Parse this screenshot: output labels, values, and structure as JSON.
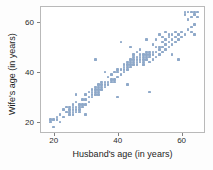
{
  "chart_data": {
    "type": "scatter",
    "title": "",
    "xlabel": "Husband's age (in years)",
    "ylabel": "Wife's age (in years)",
    "xlim": [
      16,
      67
    ],
    "ylim": [
      16,
      66
    ],
    "xticks": [
      20,
      40,
      60
    ],
    "yticks": [
      20,
      40,
      60
    ],
    "xticklabels": [
      "20",
      "40",
      "60"
    ],
    "yticklabels": [
      "20",
      "40",
      "60"
    ],
    "grid": false,
    "legend": null,
    "marker_color": "#8fa9c9",
    "frame_color": "#b9b9b9",
    "series": [
      {
        "name": "couples",
        "points": [
          [
            19,
            21
          ],
          [
            19,
            20
          ],
          [
            20,
            18
          ],
          [
            20,
            21
          ],
          [
            21,
            21
          ],
          [
            21,
            22
          ],
          [
            22,
            20
          ],
          [
            22,
            23
          ],
          [
            23,
            22
          ],
          [
            23,
            25
          ],
          [
            24,
            24
          ],
          [
            24,
            26
          ],
          [
            25,
            23
          ],
          [
            25,
            25
          ],
          [
            25,
            24
          ],
          [
            25,
            26
          ],
          [
            26,
            24
          ],
          [
            26,
            25
          ],
          [
            26,
            26
          ],
          [
            26,
            27
          ],
          [
            26,
            23
          ],
          [
            27,
            24
          ],
          [
            27,
            25
          ],
          [
            27,
            26
          ],
          [
            27,
            28
          ],
          [
            27,
            31
          ],
          [
            28,
            25
          ],
          [
            28,
            26
          ],
          [
            28,
            27
          ],
          [
            28,
            24
          ],
          [
            29,
            27
          ],
          [
            29,
            29
          ],
          [
            29,
            26
          ],
          [
            30,
            23
          ],
          [
            30,
            27
          ],
          [
            30,
            29
          ],
          [
            30,
            31
          ],
          [
            31,
            28
          ],
          [
            31,
            32
          ],
          [
            31,
            30
          ],
          [
            32,
            31
          ],
          [
            32,
            32
          ],
          [
            32,
            33
          ],
          [
            32,
            30
          ],
          [
            33,
            31
          ],
          [
            33,
            32
          ],
          [
            33,
            33
          ],
          [
            33,
            34
          ],
          [
            33,
            45
          ],
          [
            34,
            32
          ],
          [
            34,
            33
          ],
          [
            34,
            34
          ],
          [
            34,
            35
          ],
          [
            34,
            31
          ],
          [
            35,
            33
          ],
          [
            35,
            34
          ],
          [
            35,
            35
          ],
          [
            35,
            36
          ],
          [
            36,
            34
          ],
          [
            36,
            35
          ],
          [
            36,
            36
          ],
          [
            36,
            40
          ],
          [
            37,
            35
          ],
          [
            37,
            36
          ],
          [
            37,
            38
          ],
          [
            38,
            36
          ],
          [
            38,
            37
          ],
          [
            38,
            39
          ],
          [
            39,
            37
          ],
          [
            39,
            40
          ],
          [
            39,
            36
          ],
          [
            40,
            30
          ],
          [
            40,
            38
          ],
          [
            40,
            40
          ],
          [
            40,
            41
          ],
          [
            41,
            39
          ],
          [
            41,
            41
          ],
          [
            41,
            52
          ],
          [
            42,
            40
          ],
          [
            42,
            41
          ],
          [
            42,
            42
          ],
          [
            42,
            43
          ],
          [
            43,
            35
          ],
          [
            43,
            41
          ],
          [
            43,
            42
          ],
          [
            43,
            43
          ],
          [
            43,
            44
          ],
          [
            44,
            42
          ],
          [
            44,
            43
          ],
          [
            44,
            44
          ],
          [
            44,
            45
          ],
          [
            44,
            50
          ],
          [
            45,
            43
          ],
          [
            45,
            44
          ],
          [
            45,
            45
          ],
          [
            45,
            46
          ],
          [
            45,
            47
          ],
          [
            46,
            43
          ],
          [
            46,
            44
          ],
          [
            46,
            45
          ],
          [
            46,
            46
          ],
          [
            46,
            48
          ],
          [
            47,
            44
          ],
          [
            47,
            45
          ],
          [
            47,
            46
          ],
          [
            47,
            47
          ],
          [
            47,
            49
          ],
          [
            48,
            44
          ],
          [
            48,
            45
          ],
          [
            48,
            46
          ],
          [
            48,
            47
          ],
          [
            48,
            43
          ],
          [
            49,
            45
          ],
          [
            49,
            46
          ],
          [
            49,
            47
          ],
          [
            49,
            48
          ],
          [
            49,
            53
          ],
          [
            50,
            32
          ],
          [
            50,
            44
          ],
          [
            50,
            46
          ],
          [
            50,
            47
          ],
          [
            50,
            48
          ],
          [
            51,
            45
          ],
          [
            51,
            47
          ],
          [
            51,
            48
          ],
          [
            51,
            51
          ],
          [
            52,
            46
          ],
          [
            52,
            48
          ],
          [
            52,
            50
          ],
          [
            52,
            53
          ],
          [
            53,
            47
          ],
          [
            53,
            49
          ],
          [
            53,
            50
          ],
          [
            53,
            55
          ],
          [
            54,
            48
          ],
          [
            54,
            50
          ],
          [
            54,
            52
          ],
          [
            54,
            54
          ],
          [
            55,
            49
          ],
          [
            55,
            51
          ],
          [
            55,
            53
          ],
          [
            55,
            56
          ],
          [
            56,
            50
          ],
          [
            56,
            52
          ],
          [
            56,
            54
          ],
          [
            56,
            55
          ],
          [
            57,
            47
          ],
          [
            57,
            51
          ],
          [
            57,
            53
          ],
          [
            57,
            55
          ],
          [
            58,
            52
          ],
          [
            58,
            54
          ],
          [
            58,
            56
          ],
          [
            59,
            45
          ],
          [
            59,
            53
          ],
          [
            59,
            55
          ],
          [
            60,
            54
          ],
          [
            60,
            56
          ],
          [
            61,
            55
          ],
          [
            61,
            63
          ],
          [
            61,
            64
          ],
          [
            62,
            57
          ],
          [
            62,
            61
          ],
          [
            62,
            64
          ],
          [
            63,
            56
          ],
          [
            63,
            58
          ],
          [
            63,
            62
          ],
          [
            63,
            64
          ],
          [
            64,
            55
          ],
          [
            64,
            59
          ],
          [
            64,
            63
          ],
          [
            64,
            64
          ],
          [
            65,
            62
          ],
          [
            65,
            64
          ]
        ]
      }
    ]
  }
}
